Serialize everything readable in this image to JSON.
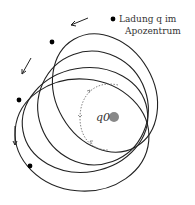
{
  "labels": {
    "charge_line1": "Ladung q im",
    "charge_line2": "Apozentrum",
    "central_charge": "q0"
  },
  "colors": {
    "orbit": "#222222",
    "dot": "#000000",
    "center": "#888888",
    "dotted_path": "#777777"
  },
  "orbits_count": 4,
  "charge_positions_count": 4
}
